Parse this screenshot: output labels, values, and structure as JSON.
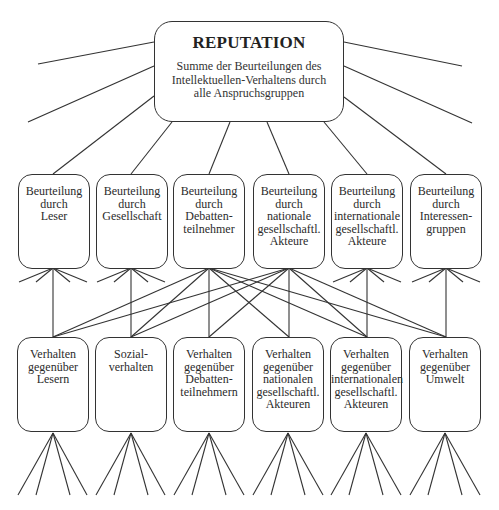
{
  "diagram": {
    "top": {
      "title": "REPUTATION",
      "subtitle_lines": [
        "Summe der Beurteilungen des",
        "Intellektuellen-Verhaltens durch",
        "alle Anspruchsgruppen"
      ]
    },
    "middle_row": [
      {
        "lines": [
          "Beurteilung",
          "durch",
          "Leser"
        ]
      },
      {
        "lines": [
          "Beurteilung",
          "durch",
          "Gesellschaft"
        ]
      },
      {
        "lines": [
          "Beurteilung",
          "durch",
          "Debatten-",
          "teilnehmer"
        ]
      },
      {
        "lines": [
          "Beurteilung",
          "durch",
          "nationale",
          "gesellschaftl.",
          "Akteure"
        ]
      },
      {
        "lines": [
          "Beurteilung",
          "durch",
          "internationale",
          "gesellschaftl.",
          "Akteure"
        ]
      },
      {
        "lines": [
          "Beurteilung",
          "durch",
          "Interessen-",
          "gruppen"
        ]
      }
    ],
    "bottom_row": [
      {
        "lines": [
          "Verhalten",
          "gegenüber",
          "Lesern"
        ]
      },
      {
        "lines": [
          "Sozial-",
          "verhalten"
        ]
      },
      {
        "lines": [
          "Verhalten",
          "gegenüber",
          "Debatten-",
          "teilnehmern"
        ]
      },
      {
        "lines": [
          "Verhalten",
          "gegenüber",
          "nationalen",
          "gesellschaftl.",
          "Akteuren"
        ]
      },
      {
        "lines": [
          "Verhalten",
          "gegenüber",
          "internationalen",
          "gesellschaftl.",
          "Akteuren"
        ]
      },
      {
        "lines": [
          "Verhalten",
          "gegenüber",
          "Umwelt"
        ]
      }
    ],
    "colors": {
      "stroke": "#333333",
      "text": "#2b2b2b",
      "background": "#ffffff"
    }
  }
}
